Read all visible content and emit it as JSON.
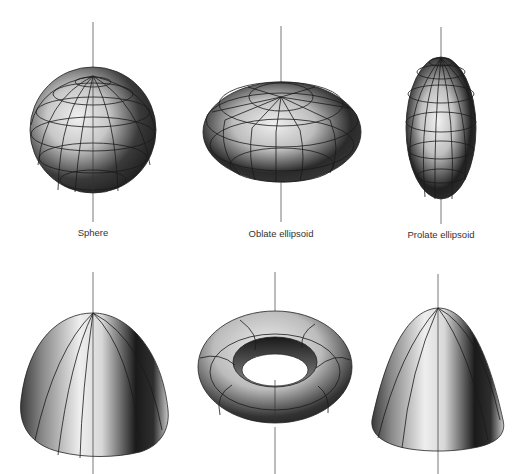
{
  "page": {
    "header_page_number": "166",
    "header_title": "GRAPHICS HARDWARE"
  },
  "figure": {
    "colors": {
      "axis": "#555555",
      "gridline": "#1a1a1a",
      "highlight": "#f2f2f2",
      "shadow": "#0d0d0d"
    },
    "shapes": [
      {
        "id": "sphere",
        "label": "Sphere",
        "row": 1,
        "cx": 93
      },
      {
        "id": "oblate-ellipsoid",
        "label": "Oblate ellipsoid",
        "row": 1,
        "cx": 281
      },
      {
        "id": "prolate-ellipsoid",
        "label": "Prolate ellipsoid",
        "row": 1,
        "cx": 441
      },
      {
        "id": "paraboloid-wide",
        "label": "",
        "row": 2,
        "cx": 93
      },
      {
        "id": "torus",
        "label": "",
        "row": 2,
        "cx": 275
      },
      {
        "id": "paraboloid-narrow",
        "label": "",
        "row": 2,
        "cx": 438
      }
    ]
  }
}
